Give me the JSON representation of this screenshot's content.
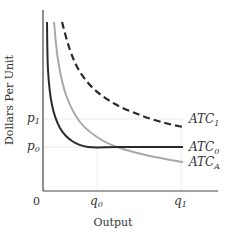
{
  "chart_data": {
    "type": "line",
    "title": "",
    "xlabel": "Output",
    "ylabel": "Dollars Per Unit",
    "origin_label": "0",
    "x_ticks": [
      {
        "label": "q",
        "sub": "0",
        "x": 97
      },
      {
        "label": "q",
        "sub": "1",
        "x": 181
      }
    ],
    "y_ticks": [
      {
        "label": "p",
        "sub": "1",
        "y": 119
      },
      {
        "label": "p",
        "sub": "0",
        "y": 147
      }
    ],
    "grid": false,
    "series": [
      {
        "name": "ATC1",
        "label": "ATC",
        "sub": "1",
        "style": "dashed",
        "color": "#222222",
        "points": [
          [
            62,
            22
          ],
          [
            70,
            50
          ],
          [
            80,
            72
          ],
          [
            95,
            90
          ],
          [
            115,
            104
          ],
          [
            140,
            115
          ],
          [
            165,
            123
          ],
          [
            183,
            127
          ]
        ]
      },
      {
        "name": "ATC0",
        "label": "ATC",
        "sub": "0",
        "style": "solid",
        "color": "#222222",
        "points": [
          [
            47,
            22
          ],
          [
            48,
            70
          ],
          [
            52,
            105
          ],
          [
            60,
            128
          ],
          [
            72,
            141
          ],
          [
            88,
            147
          ],
          [
            120,
            147
          ],
          [
            183,
            147
          ]
        ]
      },
      {
        "name": "ATCA",
        "label": "ATC",
        "sub": "A",
        "style": "solid",
        "color": "#a6a6a6",
        "points": [
          [
            54,
            22
          ],
          [
            58,
            60
          ],
          [
            66,
            95
          ],
          [
            80,
            122
          ],
          [
            100,
            139
          ],
          [
            120,
            148
          ],
          [
            150,
            156
          ],
          [
            183,
            162
          ]
        ]
      }
    ],
    "axis_color": "#333333",
    "guide_color": "#e6e6e6"
  }
}
